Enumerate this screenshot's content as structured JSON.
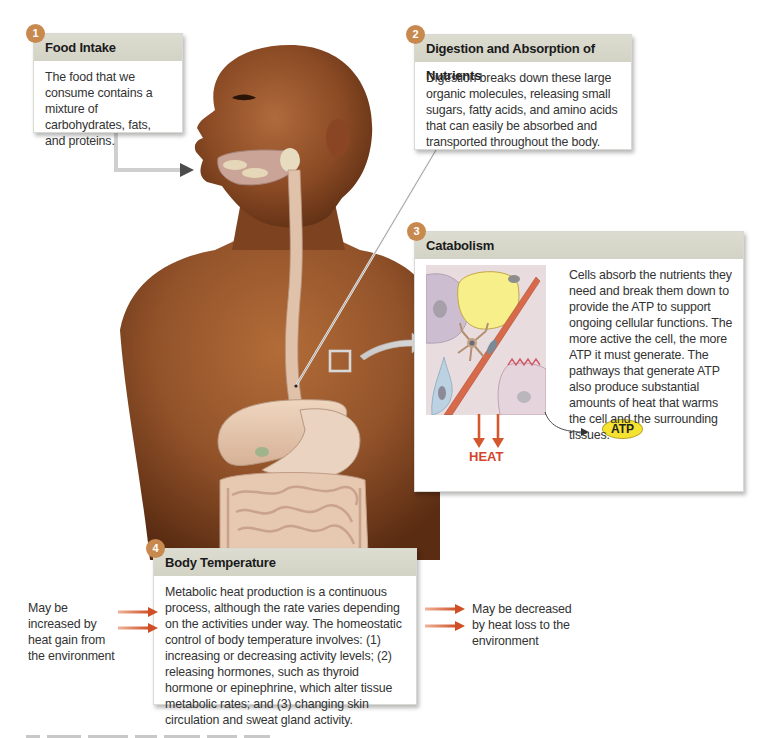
{
  "figure": {
    "type": "anatomical diagram",
    "colors": {
      "badge": "#c8894f",
      "panel_header": "#d4d5c8",
      "heat_arrow": "#d4572d",
      "heat_label": "#d4452d",
      "atp_fill": "#f5e330",
      "skin": "#8b4a22"
    }
  },
  "panels": {
    "food_intake": {
      "step": "1",
      "title": "Food Intake",
      "body": "The food that we consume contains a mixture of carbohydrates, fats, and proteins."
    },
    "digestion": {
      "step": "2",
      "title": "Digestion and Absorption of Nutrients",
      "body": "Digestion breaks down these large organic molecules, releasing small sugars, fatty acids, and amino acids that can easily be absorbed and transported throughout the body."
    },
    "catabolism": {
      "step": "3",
      "title": "Catabolism",
      "body": "Cells absorb the nutrients they need and break them down to provide the ATP to support ongoing cellular functions. The more active the cell, the more ATP it must generate. The pathways that generate ATP also produce substantial amounts of heat that warms the cell and the surrounding tissues.",
      "heat_label": "HEAT",
      "atp_label": "ATP"
    },
    "body_temperature": {
      "step": "4",
      "title": "Body Temperature",
      "body": "Metabolic heat production is a continuous process, although the rate varies depending on the activities under way. The homeostatic control of body temperature involves: (1) increasing or decreasing activity levels; (2) releasing hormones, such as thyroid hormone or epinephrine, which alter tissue metabolic rates; and (3) changing skin circulation and sweat gland activity."
    }
  },
  "side_notes": {
    "heat_gain": "May be increased by heat gain from the environment",
    "heat_loss": "May be decreased by heat loss to the environment"
  }
}
